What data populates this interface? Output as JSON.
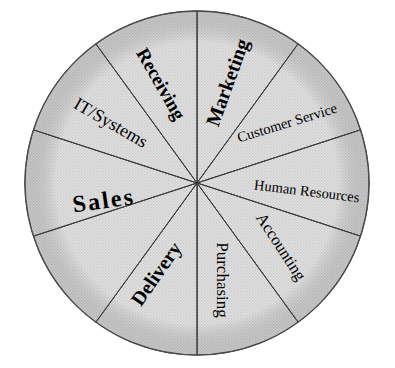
{
  "figure": {
    "name": "business-function-wheel",
    "shape": "circle",
    "segment_count": 10,
    "fill_color": "#d9d9d9",
    "line_color": "#3a3a3a",
    "text_color": "#000000",
    "background_color": "#ffffff"
  },
  "chart_data": {
    "type": "pie",
    "title": "",
    "xlabel": "",
    "ylabel": "",
    "legend": "none",
    "grid": false,
    "equal_slices": true,
    "categories": [
      "Marketing",
      "Customer Service",
      "Human Resources",
      "Accounting",
      "Purchasing",
      "Delivery",
      "Sales",
      "IT/Systems",
      "Receiving"
    ],
    "values": [
      11.1,
      11.1,
      11.1,
      11.1,
      11.1,
      11.1,
      22.2,
      11.1,
      11.1
    ],
    "slice_count": 10,
    "note": "Sales spans two adjacent slices; all other labels occupy one slice each."
  },
  "segments": [
    {
      "id": "marketing",
      "label": "Marketing",
      "start_angle": -90,
      "end_angle": -54,
      "label_angle": -72,
      "label_radius": 105,
      "text_rotation": -70,
      "font_size": 20,
      "bold": true,
      "letter_spacing": 0
    },
    {
      "id": "customer-service",
      "label": "Customer Service",
      "start_angle": -54,
      "end_angle": -18,
      "label_angle": -33,
      "label_radius": 108,
      "text_rotation": -17,
      "font_size": 14.5,
      "bold": false,
      "letter_spacing": 0
    },
    {
      "id": "human-resources",
      "label": "Human Resources",
      "start_angle": -18,
      "end_angle": 18,
      "label_angle": 5,
      "label_radius": 110,
      "text_rotation": 7,
      "font_size": 14.5,
      "bold": false,
      "letter_spacing": 0
    },
    {
      "id": "accounting",
      "label": "Accounting",
      "start_angle": 18,
      "end_angle": 54,
      "label_angle": 38,
      "label_radius": 105,
      "text_rotation": 57,
      "font_size": 16.5,
      "bold": false,
      "letter_spacing": 0
    },
    {
      "id": "purchasing",
      "label": "Purchasing",
      "start_angle": 54,
      "end_angle": 90,
      "label_angle": 76,
      "label_radius": 100,
      "text_rotation": 90,
      "font_size": 17,
      "bold": false,
      "letter_spacing": 0
    },
    {
      "id": "delivery",
      "label": "Delivery",
      "start_angle": 90,
      "end_angle": 126,
      "label_angle": 113,
      "label_radius": 100,
      "text_rotation": -55,
      "font_size": 20,
      "bold": true,
      "letter_spacing": 0
    },
    {
      "id": "sales",
      "label": "Sales",
      "start_angle": 126,
      "end_angle": 198,
      "label_angle": 168,
      "label_radius": 95,
      "text_rotation": -8,
      "font_size": 24,
      "bold": true,
      "letter_spacing": 2.2
    },
    {
      "id": "it-systems",
      "label": "IT/Systems",
      "start_angle": 198,
      "end_angle": 234,
      "label_angle": 214,
      "label_radius": 105,
      "text_rotation": 30,
      "font_size": 18,
      "bold": false,
      "letter_spacing": 0
    },
    {
      "id": "receiving",
      "label": "Receiving",
      "start_angle": 234,
      "end_angle": 270,
      "label_angle": 249,
      "label_radius": 105,
      "text_rotation": 60,
      "font_size": 19,
      "bold": true,
      "letter_spacing": 0
    }
  ],
  "divider_angles": [
    -90,
    -54,
    -18,
    18,
    54,
    90,
    126,
    162,
    198,
    234
  ],
  "geometry": {
    "center_x": 197,
    "center_y": 183,
    "radius": 172
  }
}
